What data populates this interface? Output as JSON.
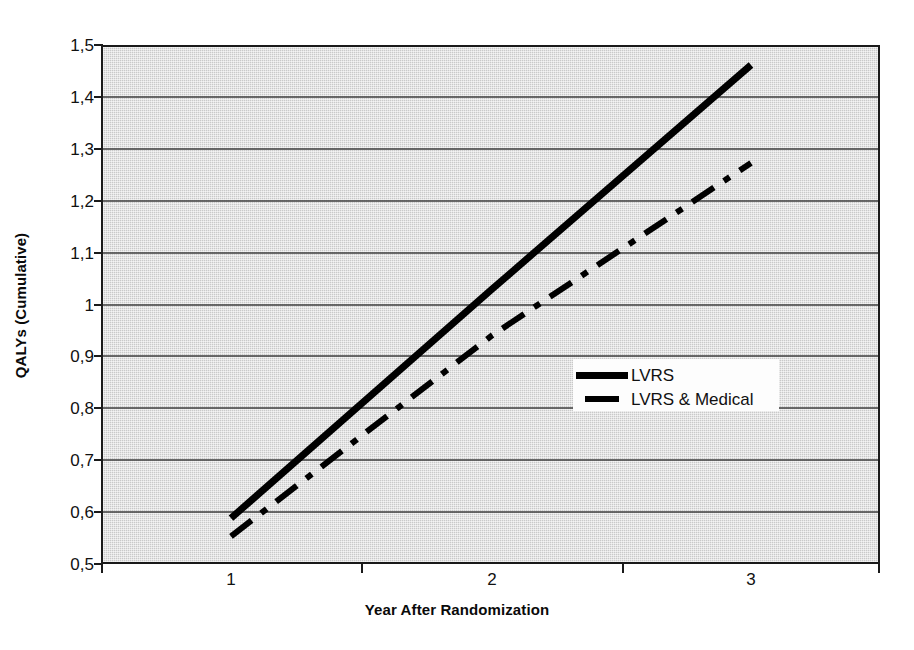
{
  "chart_data": {
    "type": "line",
    "title": "",
    "xlabel": "Year After Randomization",
    "ylabel": "QALYs (Cumulative)",
    "x": [
      1,
      2,
      3
    ],
    "xtick_labels": [
      "1",
      "2",
      "3"
    ],
    "ytick_labels": [
      "0,5",
      "0,6",
      "0,7",
      "0,8",
      "0,9",
      "1",
      "1,1",
      "1,2",
      "1,3",
      "1,4",
      "1,5"
    ],
    "ytick_values": [
      0.5,
      0.6,
      0.7,
      0.8,
      0.9,
      1.0,
      1.1,
      1.2,
      1.3,
      1.4,
      1.5
    ],
    "ylim": [
      0.5,
      1.5
    ],
    "grid": "horizontal",
    "legend_position": "center-right",
    "series": [
      {
        "name": "LVRS",
        "style": "solid",
        "color": "#000000",
        "values": [
          0.585,
          1.03,
          1.465
        ]
      },
      {
        "name": "LVRS & Medical",
        "style": "dash-dot",
        "color": "#000000",
        "values": [
          0.55,
          0.94,
          1.275
        ]
      }
    ]
  },
  "axes": {
    "y_title": "QALYs (Cumulative)",
    "x_title": "Year After Randomization",
    "y_labels": [
      "1,5",
      "1,4",
      "1,3",
      "1,2",
      "1,1",
      "1",
      "0,9",
      "0,8",
      "0,7",
      "0,6",
      "0,5"
    ],
    "x_labels": [
      "1",
      "2",
      "3"
    ]
  },
  "legend": {
    "items": [
      {
        "label": "LVRS",
        "marker": "solid-line-swatch"
      },
      {
        "label": "LVRS & Medical",
        "marker": "dashed-line-swatch"
      }
    ]
  },
  "colors": {
    "plot_background": "#c9c9c9",
    "frame": "#1a1a1a",
    "gridline": "#3d3d3d",
    "series_line": "#000000",
    "legend_background": "#fdfdfd",
    "page_background": "#ffffff"
  }
}
